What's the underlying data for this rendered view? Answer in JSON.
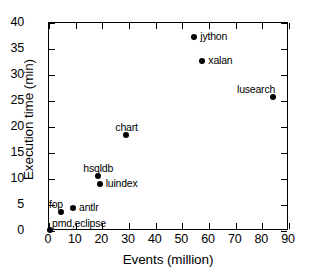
{
  "chart_data": {
    "type": "scatter",
    "title": "",
    "xlabel": "Events (million)",
    "ylabel": "Execution time (min)",
    "xlim": [
      0,
      90
    ],
    "ylim": [
      0,
      40
    ],
    "xticks": [
      0,
      10,
      20,
      30,
      40,
      50,
      60,
      70,
      80,
      90
    ],
    "yticks": [
      0,
      5,
      10,
      15,
      20,
      25,
      30,
      35,
      40
    ],
    "grid": false,
    "legend": "none",
    "marker": "filled-circle",
    "marker_color": "#000000",
    "points": [
      {
        "label": "pmd,eclipse",
        "x": 0.4,
        "y": 0.2,
        "label_pos": "above-right"
      },
      {
        "label": "fop",
        "x": 4.5,
        "y": 3.6,
        "label_pos": "above-left"
      },
      {
        "label": "antlr",
        "x": 9.0,
        "y": 4.5,
        "label_pos": "right"
      },
      {
        "label": "hsqldb",
        "x": 18.5,
        "y": 10.5,
        "label_pos": "above"
      },
      {
        "label": "luindex",
        "x": 19.0,
        "y": 9.0,
        "label_pos": "right"
      },
      {
        "label": "chart",
        "x": 29.0,
        "y": 18.5,
        "label_pos": "above"
      },
      {
        "label": "jython",
        "x": 54.5,
        "y": 37.4,
        "label_pos": "right"
      },
      {
        "label": "xalan",
        "x": 57.5,
        "y": 32.6,
        "label_pos": "right"
      },
      {
        "label": "lusearch",
        "x": 84.0,
        "y": 25.7,
        "label_pos": "above-left"
      }
    ]
  }
}
